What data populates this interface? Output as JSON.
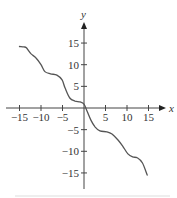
{
  "chart_data": {
    "type": "line",
    "title": "",
    "xlabel": "x",
    "ylabel": "y",
    "xlim": [
      -15,
      17
    ],
    "ylim": [
      -18,
      19
    ],
    "grid": false,
    "legend": null,
    "x_ticks": [
      -15,
      -10,
      -5,
      5,
      10,
      15
    ],
    "x_tick_labels": [
      "−15",
      "−10",
      "−5",
      "5",
      "10",
      "15"
    ],
    "y_ticks": [
      15,
      10,
      5,
      -5,
      -10,
      -15
    ],
    "y_tick_labels": [
      "15",
      "10",
      "5",
      "−5",
      "−10",
      "−15"
    ],
    "series": [
      {
        "name": "curve",
        "color": "#555555",
        "x": [
          -15.0,
          -14.0,
          -13.4,
          -12.3,
          -11.2,
          -10.0,
          -9.1,
          -7.8,
          -6.3,
          -5.1,
          -4.4,
          -3.3,
          -2.1,
          -0.9,
          0.0,
          0.7,
          1.6,
          2.6,
          3.7,
          5.3,
          6.5,
          7.9,
          9.0,
          10.2,
          11.3,
          12.4,
          13.6,
          14.7
        ],
        "y": [
          14.2,
          14.1,
          13.9,
          12.5,
          11.6,
          10.0,
          8.4,
          7.9,
          7.6,
          6.5,
          4.6,
          2.3,
          1.6,
          1.4,
          0.9,
          -0.7,
          -2.8,
          -4.4,
          -5.3,
          -5.5,
          -6.0,
          -7.4,
          -8.8,
          -10.6,
          -11.3,
          -11.5,
          -12.7,
          -15.5
        ]
      }
    ],
    "colors": {
      "axis": "#444444",
      "curve": "#555555",
      "text": "#333333",
      "rule": "#dddddd"
    }
  }
}
